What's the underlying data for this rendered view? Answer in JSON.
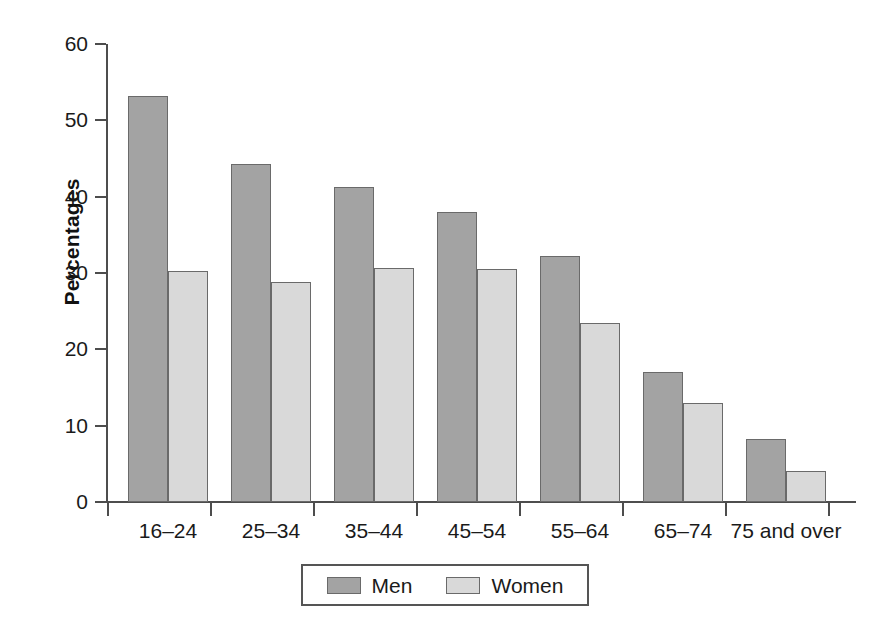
{
  "chart_data": {
    "type": "bar",
    "title": "",
    "xlabel": "",
    "ylabel": "Percentages",
    "ylim": [
      0,
      60
    ],
    "yticks": [
      0,
      10,
      20,
      30,
      40,
      50,
      60
    ],
    "grid": false,
    "legend_position": "bottom",
    "categories": [
      "16–24",
      "25–34",
      "35–44",
      "45–54",
      "55–64",
      "65–74",
      "75 and over"
    ],
    "series": [
      {
        "name": "Men",
        "color": "#a3a3a3",
        "values": [
          53.2,
          44.3,
          41.3,
          38.0,
          32.2,
          17.0,
          8.3
        ]
      },
      {
        "name": "Women",
        "color": "#d9d9d9",
        "values": [
          30.2,
          28.8,
          30.6,
          30.5,
          23.4,
          13.0,
          4.1
        ]
      }
    ]
  },
  "legend": {
    "entries": [
      {
        "label": "Men"
      },
      {
        "label": "Women"
      }
    ]
  },
  "colors": {
    "men": "#a3a3a3",
    "women": "#d9d9d9",
    "axis": "#4d4d4d",
    "bar_outline": "#6a6a6a",
    "background": "#ffffff"
  }
}
